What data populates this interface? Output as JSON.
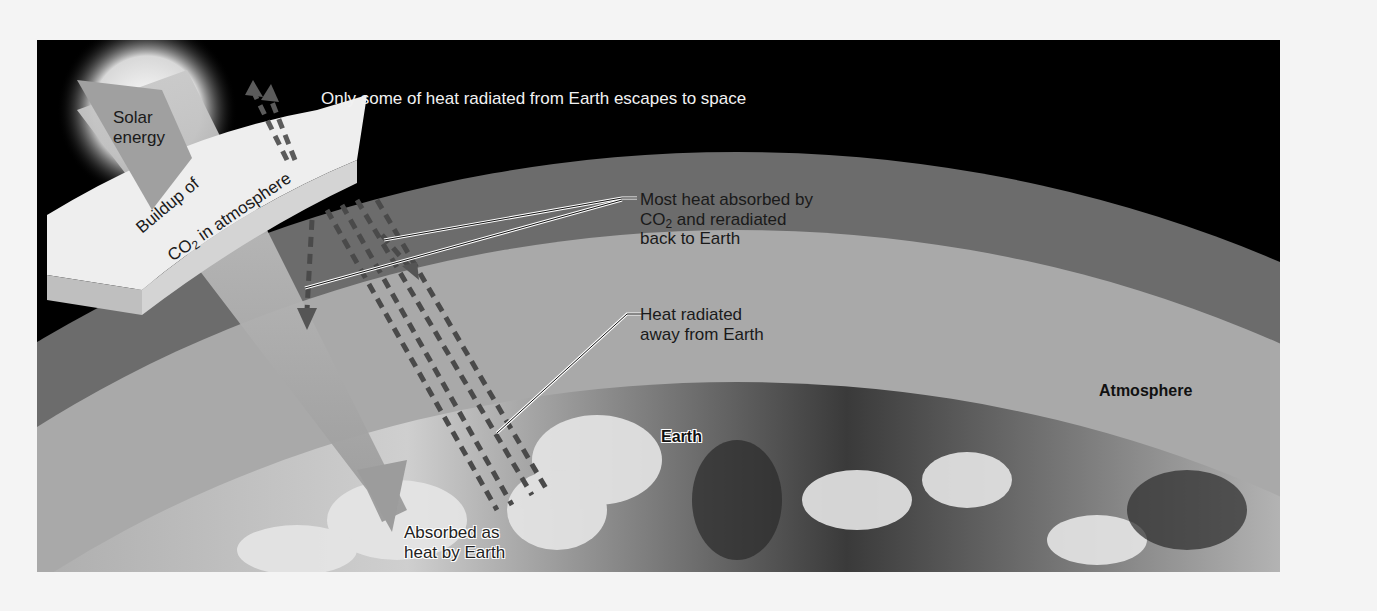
{
  "figure": {
    "labels": {
      "solar_energy_line1": "Solar",
      "solar_energy_line2": "energy",
      "escapes_to_space": "Only some of heat radiated from Earth escapes to space",
      "buildup_line1": "Buildup of",
      "buildup_co2_prefix": "CO",
      "buildup_co2_sub": "2",
      "buildup_co2_suffix": " in atmosphere",
      "most_heat_line1": "Most heat absorbed by",
      "most_heat_co2_prefix": "CO",
      "most_heat_co2_sub": "2",
      "most_heat_line2_suffix": " and reradiated",
      "most_heat_line3": "back to Earth",
      "heat_radiated_line1": "Heat radiated",
      "heat_radiated_line2": "away from Earth",
      "atmosphere": "Atmosphere",
      "earth": "Earth",
      "absorbed_line1": "Absorbed as",
      "absorbed_line2": "heat by Earth"
    },
    "colors": {
      "space": "#000000",
      "outer_atmosphere": "#6e6e6e",
      "inner_atmosphere": "#a8a8a8",
      "co2_slab": "#ececec",
      "arrows": "#5a5a5a"
    }
  }
}
